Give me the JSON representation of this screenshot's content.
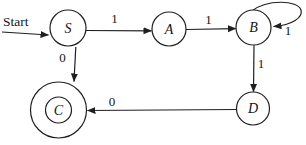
{
  "diagram": {
    "type": "finite-automaton",
    "background": "#ffffff",
    "ink": "#1f1f1f",
    "start_label": "Start",
    "start_arrow": {
      "x1": 2,
      "y1": 32,
      "x2": 48.5,
      "y2": 35,
      "label_x": 3,
      "label_y": 25.5
    },
    "states": [
      {
        "id": "S",
        "label": "S",
        "x": 68,
        "y": 28,
        "r": 18,
        "accepting": false
      },
      {
        "id": "A",
        "label": "A",
        "x": 169,
        "y": 29,
        "r": 17,
        "accepting": false
      },
      {
        "id": "B",
        "label": "B",
        "x": 253.5,
        "y": 27.5,
        "r": 17.5,
        "accepting": false
      },
      {
        "id": "C",
        "label": "C",
        "x": 58.5,
        "y": 110,
        "r": 28,
        "inner_r": 13,
        "accepting": true
      },
      {
        "id": "D",
        "label": "D",
        "x": 253,
        "y": 108.5,
        "r": 16.5,
        "accepting": false
      }
    ],
    "transitions": [
      {
        "from": "S",
        "to": "A",
        "label": "1",
        "x1": 86,
        "y1": 30.5,
        "x2": 151.5,
        "y2": 30.8,
        "label_x": 114.5,
        "label_y": 23
      },
      {
        "from": "A",
        "to": "B",
        "label": "1",
        "x1": 186,
        "y1": 29.5,
        "x2": 235.8,
        "y2": 28.6,
        "label_x": 208.5,
        "label_y": 24
      },
      {
        "from": "B",
        "to": "B",
        "label": "1",
        "loop": true,
        "path": "M 252 11 C 267 -1 298 0 301 10 C 303 17.5 292.5 25 273.5 26.5",
        "label_x": 288,
        "label_y": 35
      },
      {
        "from": "B",
        "to": "D",
        "label": "1",
        "x1": 254,
        "y1": 45.2,
        "x2": 253.5,
        "y2": 91.8,
        "label_x": 261,
        "label_y": 67.5
      },
      {
        "from": "S",
        "to": "C",
        "label": "0",
        "x1": 75.8,
        "y1": 47,
        "x2": 74,
        "y2": 81.5,
        "label_x": 62.5,
        "label_y": 62
      },
      {
        "from": "D",
        "to": "C",
        "label": "0",
        "x1": 236.5,
        "y1": 109.5,
        "x2": 87.5,
        "y2": 110.5,
        "label_x": 112,
        "label_y": 106
      }
    ]
  }
}
